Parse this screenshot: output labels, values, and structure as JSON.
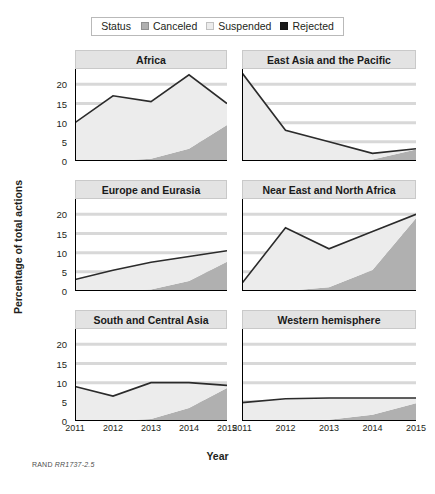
{
  "legend": {
    "title": "Status",
    "items": [
      {
        "label": "Canceled",
        "color": "#b0b0b0"
      },
      {
        "label": "Suspended",
        "color": "#ececec"
      },
      {
        "label": "Rejected",
        "color": "#1a1a1a"
      }
    ]
  },
  "footer": {
    "org": "RAND",
    "id": "RR1737-2.5"
  },
  "chart_data": {
    "type": "area",
    "title": "",
    "xlabel": "Year",
    "ylabel": "Percentage of total actions",
    "x": [
      "2011",
      "2012",
      "2013",
      "2014",
      "2015"
    ],
    "ylim": [
      0,
      24
    ],
    "yticks": [
      0,
      5,
      10,
      15,
      20
    ],
    "grid": true,
    "legend_position": "top-center",
    "stacked": true,
    "series_names": [
      "Canceled",
      "Suspended",
      "Rejected"
    ],
    "panels": [
      {
        "title": "Africa",
        "series": [
          {
            "name": "Canceled",
            "values": [
              0,
              0,
              0.6,
              3.2,
              9.4
            ]
          },
          {
            "name": "Suspended",
            "values": [
              10.0,
              17.0,
              14.9,
              19.3,
              5.6
            ]
          },
          {
            "name": "Rejected",
            "values": [
              0,
              0,
              0,
              0,
              0
            ]
          }
        ],
        "total": [
          10.0,
          17.0,
          15.5,
          22.5,
          15.0
        ]
      },
      {
        "title": "East Asia and the Pacific",
        "series": [
          {
            "name": "Canceled",
            "values": [
              0,
              0,
              0,
              0.4,
              3.0
            ]
          },
          {
            "name": "Suspended",
            "values": [
              23.0,
              8.0,
              5.0,
              1.6,
              0.2
            ]
          },
          {
            "name": "Rejected",
            "values": [
              0,
              0,
              0,
              0,
              0
            ]
          }
        ],
        "total": [
          23.0,
          8.0,
          5.0,
          2.0,
          3.2
        ]
      },
      {
        "title": "Europe and Eurasia",
        "series": [
          {
            "name": "Canceled",
            "values": [
              0,
              0,
              0.4,
              2.6,
              7.6
            ]
          },
          {
            "name": "Suspended",
            "values": [
              3.0,
              5.4,
              7.1,
              6.4,
              2.9
            ]
          },
          {
            "name": "Rejected",
            "values": [
              0,
              0,
              0,
              0,
              0
            ]
          }
        ],
        "total": [
          3.0,
          5.4,
          7.5,
          9.0,
          10.5
        ]
      },
      {
        "title": "Near East and North Africa",
        "series": [
          {
            "name": "Canceled",
            "values": [
              0,
              0,
              1.0,
              5.5,
              19.0
            ]
          },
          {
            "name": "Suspended",
            "values": [
              2.0,
              16.5,
              10.0,
              10.0,
              1.0
            ]
          },
          {
            "name": "Rejected",
            "values": [
              0,
              0,
              0,
              0,
              0
            ]
          }
        ],
        "total": [
          2.0,
          16.5,
          11.0,
          15.5,
          20.0
        ]
      },
      {
        "title": "South and Central Asia",
        "series": [
          {
            "name": "Canceled",
            "values": [
              0,
              0,
              0.5,
              3.4,
              8.6
            ]
          },
          {
            "name": "Suspended",
            "values": [
              9.0,
              6.5,
              9.5,
              6.6,
              0.7
            ]
          },
          {
            "name": "Rejected",
            "values": [
              0,
              0,
              0,
              0,
              0
            ]
          }
        ],
        "total": [
          9.0,
          6.5,
          10.0,
          10.0,
          9.3
        ]
      },
      {
        "title": "Western hemisphere",
        "series": [
          {
            "name": "Canceled",
            "values": [
              0,
              0,
              0.3,
              1.6,
              4.6
            ]
          },
          {
            "name": "Suspended",
            "values": [
              4.8,
              5.8,
              5.7,
              4.4,
              1.4
            ]
          },
          {
            "name": "Rejected",
            "values": [
              0,
              0,
              0,
              0,
              0
            ]
          }
        ],
        "total": [
          4.8,
          5.8,
          6.0,
          6.0,
          6.0
        ]
      }
    ]
  }
}
